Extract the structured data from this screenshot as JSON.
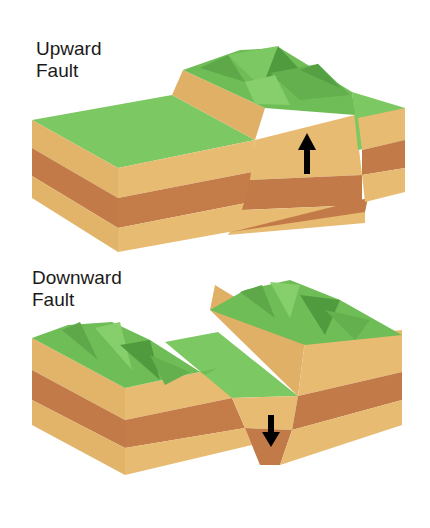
{
  "diagrams": [
    {
      "title_line1": "Upward",
      "title_line2": "Fault",
      "arrow": "up-arrow-icon"
    },
    {
      "title_line1": "Downward",
      "title_line2": "Fault",
      "arrow": "down-arrow-icon"
    }
  ],
  "colors": {
    "grass": "#7cc862",
    "grass_dark": "#5ea84a",
    "sand_light": "#e6b86e",
    "sand_side": "#d9a55a",
    "clay": "#c27b48",
    "clay_side": "#b36b3c"
  }
}
